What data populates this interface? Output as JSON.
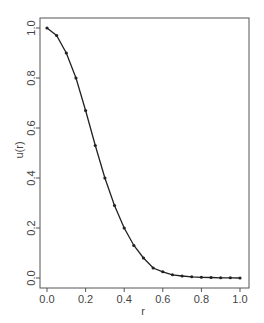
{
  "chart_data": {
    "type": "line",
    "title": "",
    "xlabel": "r",
    "ylabel": "u(r)",
    "xlim": [
      0.0,
      1.0
    ],
    "ylim": [
      0.0,
      1.0
    ],
    "grid": false,
    "legend": null,
    "x_ticks": [
      "0.0",
      "0.2",
      "0.4",
      "0.6",
      "0.8",
      "1.0"
    ],
    "y_ticks": [
      "0.0",
      "0.2",
      "0.4",
      "0.6",
      "0.8",
      "1.0"
    ],
    "series": [
      {
        "name": "u(r)",
        "marker": "point",
        "color": "#222222",
        "x": [
          0.0,
          0.05,
          0.1,
          0.15,
          0.2,
          0.25,
          0.3,
          0.35,
          0.4,
          0.45,
          0.5,
          0.55,
          0.6,
          0.65,
          0.7,
          0.75,
          0.8,
          0.85,
          0.9,
          0.95,
          1.0
        ],
        "values": [
          1.0,
          0.97,
          0.9,
          0.8,
          0.67,
          0.53,
          0.4,
          0.29,
          0.2,
          0.13,
          0.08,
          0.04,
          0.025,
          0.013,
          0.008,
          0.005,
          0.003,
          0.002,
          0.001,
          0.001,
          0.0
        ]
      }
    ]
  },
  "colors": {
    "frame": "#555555",
    "line": "#222222",
    "text": "#444444"
  }
}
